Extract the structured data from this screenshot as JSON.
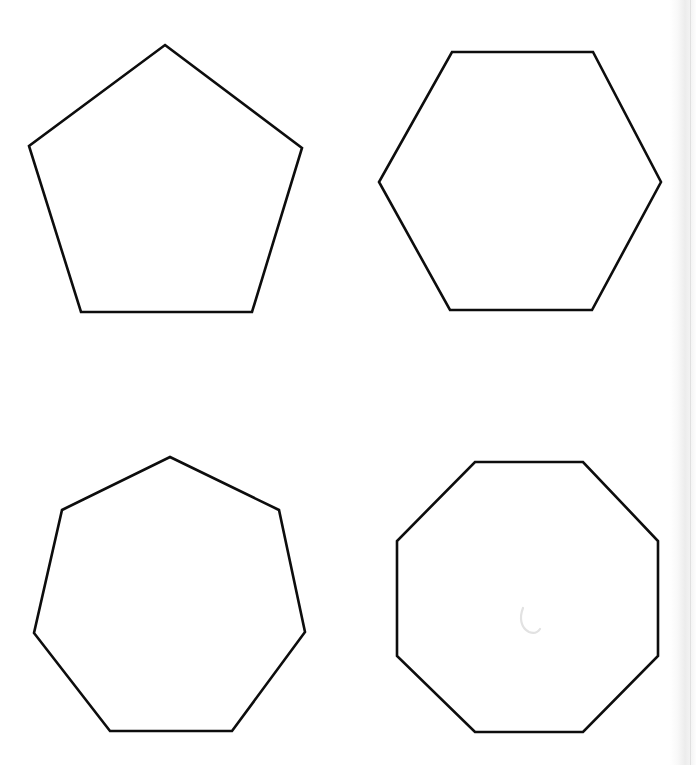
{
  "page": {
    "width": 696,
    "height": 765,
    "background_color": "#ffffff",
    "stroke_color": "#0d0d0d",
    "stroke_width": 2.6
  },
  "shapes": [
    {
      "id": "pentagon",
      "name": "Regular pentagon",
      "sides": 5,
      "grid_position": "top-left",
      "points": "165,45 302,148 252,312 81,312 29,146",
      "center": [
        166,
        180
      ],
      "approx_width": 273,
      "approx_height": 267
    },
    {
      "id": "hexagon",
      "name": "Regular hexagon",
      "sides": 6,
      "grid_position": "top-right",
      "points": "452,52 593,52 661,182 592,310 450,310 379,182",
      "center": [
        520,
        181
      ],
      "approx_width": 282,
      "approx_height": 258
    },
    {
      "id": "heptagon",
      "name": "Regular heptagon",
      "sides": 7,
      "grid_position": "bottom-left",
      "points": "170,457 279,510 305,632 232,731 110,731 34,633 62,510",
      "center": [
        170,
        600
      ],
      "approx_width": 271,
      "approx_height": 274
    },
    {
      "id": "octagon",
      "name": "Regular octagon",
      "sides": 8,
      "grid_position": "bottom-right",
      "points": "475,462 583,462 658,541 658,656 583,732 475,732 397,656 397,541",
      "center": [
        527,
        597
      ],
      "approx_width": 261,
      "approx_height": 270
    }
  ],
  "artifacts": {
    "pencil_mark": {
      "name": "faint-pencil-hook-mark",
      "path": "M 523,608 C 519,618 521,628 529,632 C 534,634 538,632 540,629",
      "color": "#e2e2e2",
      "location": "inside octagon, near center"
    },
    "scan_edge_band": {
      "name": "scanner-shadow-band",
      "color": "#ebebeb",
      "location": "right edge of page"
    }
  }
}
